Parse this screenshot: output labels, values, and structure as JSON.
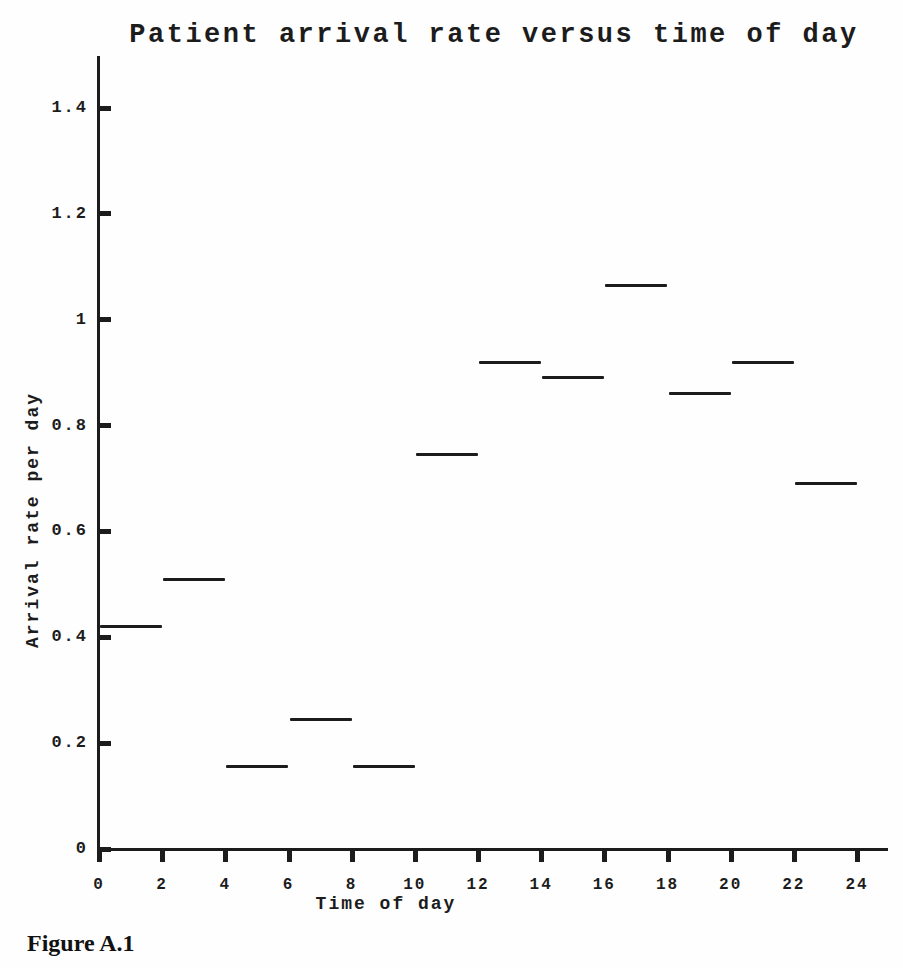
{
  "figure": {
    "caption": "Figure A.1"
  },
  "chart_data": {
    "type": "line",
    "style": "step: piecewise-constant horizontal segments, one per 2-hour interval",
    "title": "Patient arrival rate versus time of day",
    "xlabel": "Time of day",
    "ylabel": "Arrival rate per day",
    "xlim": [
      0,
      25
    ],
    "ylim": [
      0,
      1.5
    ],
    "grid": false,
    "legend": null,
    "ink_color": "#1c1c1c",
    "background_color": "#fefefe",
    "x_ticks": [
      0,
      2,
      4,
      6,
      8,
      10,
      12,
      14,
      16,
      18,
      20,
      22,
      24
    ],
    "x_tick_labels": [
      "0",
      "2",
      "4",
      "6",
      "8",
      "10",
      "12",
      "14",
      "16",
      "18",
      "20",
      "22",
      "24"
    ],
    "y_ticks": [
      0,
      0.2,
      0.4,
      0.6,
      0.8,
      1.0,
      1.2,
      1.4
    ],
    "y_tick_labels": [
      "0",
      "0.2",
      "0.4",
      "0.6",
      "0.8",
      "1",
      "1.2",
      "1.4"
    ],
    "series_name": "Patient arrival rate",
    "segments": [
      {
        "x_start": 0,
        "x_end": 2,
        "value": 0.42
      },
      {
        "x_start": 2,
        "x_end": 4,
        "value": 0.51
      },
      {
        "x_start": 4,
        "x_end": 6,
        "value": 0.155
      },
      {
        "x_start": 6,
        "x_end": 8,
        "value": 0.245
      },
      {
        "x_start": 8,
        "x_end": 10,
        "value": 0.155
      },
      {
        "x_start": 10,
        "x_end": 12,
        "value": 0.745
      },
      {
        "x_start": 12,
        "x_end": 14,
        "value": 0.92
      },
      {
        "x_start": 14,
        "x_end": 16,
        "value": 0.89
      },
      {
        "x_start": 16,
        "x_end": 18,
        "value": 1.065
      },
      {
        "x_start": 18,
        "x_end": 20,
        "value": 0.86
      },
      {
        "x_start": 20,
        "x_end": 22,
        "value": 0.92
      },
      {
        "x_start": 22,
        "x_end": 24,
        "value": 0.69
      }
    ]
  }
}
